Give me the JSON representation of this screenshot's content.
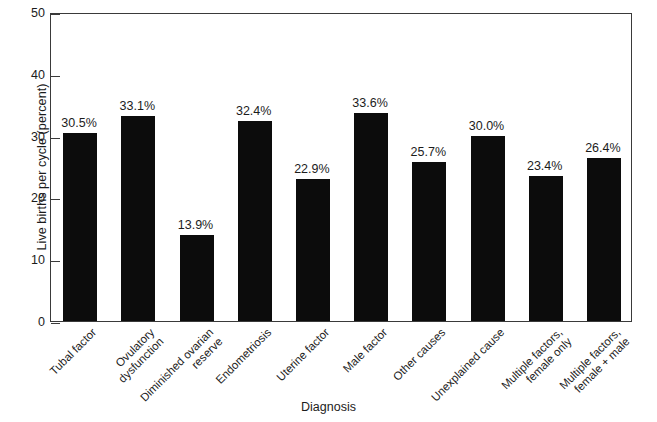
{
  "chart_data": {
    "type": "bar",
    "title": "",
    "subtitle": "",
    "xlabel": "Diagnosis",
    "ylabel": "Live births per cycle (percent)",
    "categories": [
      "Tubal factor",
      "Ovulatory dysfunction",
      "Diminished ovarian reserve",
      "Endometriosis",
      "Uterine factor",
      "Male factor",
      "Other causes",
      "Unexplained cause",
      "Multiple factors, female only",
      "Multiple factors, female + male"
    ],
    "category_label_lines": [
      [
        "Tubal factor"
      ],
      [
        "Ovulatory",
        "dysfunction"
      ],
      [
        "Diminished ovarian",
        "reserve"
      ],
      [
        "Endometriosis"
      ],
      [
        "Uterine factor"
      ],
      [
        "Male factor"
      ],
      [
        "Other causes"
      ],
      [
        "Unexplained cause"
      ],
      [
        "Multiple factors,",
        "female only"
      ],
      [
        "Multiple factors,",
        "female + male"
      ]
    ],
    "values": [
      30.5,
      33.1,
      13.9,
      32.4,
      22.9,
      33.6,
      25.7,
      30.0,
      23.4,
      26.4
    ],
    "value_labels": [
      "30.5%",
      "33.1%",
      "13.9%",
      "32.4%",
      "22.9%",
      "33.6%",
      "25.7%",
      "30.0%",
      "23.4%",
      "26.4%"
    ],
    "ylim": [
      0,
      50
    ],
    "yticks": [
      0,
      10,
      20,
      30,
      40,
      50
    ],
    "ytick_labels": [
      "0",
      "10",
      "20",
      "30",
      "40",
      "50"
    ],
    "grid": false,
    "legend": null,
    "bar_color": "#0c0c0c",
    "axis_color": "#3a3a3a",
    "background_color": "#ffffff"
  }
}
